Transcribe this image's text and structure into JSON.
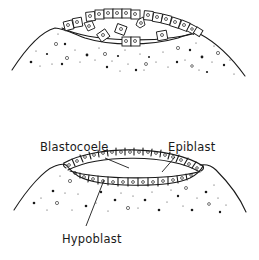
{
  "figure": {
    "type": "biological-diagram",
    "panels": [
      {
        "id": "top",
        "description": "early blastoderm with scattered delaminating cells above yolk",
        "labels": []
      },
      {
        "id": "bottom",
        "description": "two-layered blastoderm with cavity between epiblast and hypoblast",
        "labels": [
          {
            "text": "Blastocoele",
            "x": 40,
            "y": 151
          },
          {
            "text": "Epiblast",
            "x": 168,
            "y": 151
          },
          {
            "text": "Hypoblast",
            "x": 62,
            "y": 243
          }
        ]
      }
    ]
  },
  "labels": {
    "blastocoele": "Blastocoele",
    "epiblast": "Epiblast",
    "hypoblast": "Hypoblast"
  },
  "colors": {
    "ink": "#1a1a1a",
    "background": "#ffffff"
  }
}
